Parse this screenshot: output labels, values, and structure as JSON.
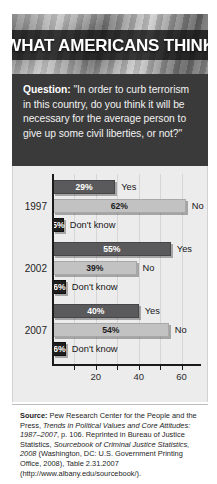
{
  "header": {
    "title": "WHAT AMERICANS THINK",
    "background": "american-flag-photo",
    "band_color": "#121212"
  },
  "question": {
    "label": "Question:",
    "text": "\"In order to curb terrorism in this country, do you think it will be necessary for the average person to give up some civil liberties, or not?\""
  },
  "chart_data": {
    "type": "bar",
    "orientation": "horizontal",
    "title": "",
    "xlabel": "",
    "ylabel": "",
    "xlim": [
      0,
      70
    ],
    "ticks": [
      20,
      40,
      60
    ],
    "minor_ticks": [
      10,
      20,
      30,
      40,
      50,
      60
    ],
    "grid": true,
    "legend": "inline-end-labels",
    "categories": [
      "1997",
      "2002",
      "2007"
    ],
    "series": [
      {
        "name": "Yes",
        "values": [
          29,
          55,
          40
        ],
        "color": "#5a5a5c"
      },
      {
        "name": "No",
        "values": [
          62,
          39,
          54
        ],
        "color": "#c2c2c2"
      },
      {
        "name": "Don't know",
        "values": [
          5,
          6,
          6
        ],
        "color": "#1e1e1e"
      }
    ],
    "groups": [
      {
        "year": "1997",
        "bars": [
          {
            "label": "Yes",
            "value": 29,
            "display": "29%",
            "style": "yes"
          },
          {
            "label": "No",
            "value": 62,
            "display": "62%",
            "style": "no"
          },
          {
            "label": "Don't know",
            "value": 5,
            "display": "5%",
            "style": "dk"
          }
        ]
      },
      {
        "year": "2002",
        "bars": [
          {
            "label": "Yes",
            "value": 55,
            "display": "55%",
            "style": "yes"
          },
          {
            "label": "No",
            "value": 39,
            "display": "39%",
            "style": "no"
          },
          {
            "label": "Don't know",
            "value": 6,
            "display": "6%",
            "style": "dk"
          }
        ]
      },
      {
        "year": "2007",
        "bars": [
          {
            "label": "Yes",
            "value": 40,
            "display": "40%",
            "style": "yes"
          },
          {
            "label": "No",
            "value": 54,
            "display": "54%",
            "style": "no"
          },
          {
            "label": "Don't know",
            "value": 6,
            "display": "6%",
            "style": "dk"
          }
        ]
      }
    ]
  },
  "source": {
    "label": "Source:",
    "segments": [
      {
        "text": " Pew Research Center for the People and the Press, ",
        "style": "normal"
      },
      {
        "text": "Trends in Political Values and Core Attitudes: 1987–2007",
        "style": "italic"
      },
      {
        "text": ", p. 106. Reprinted in Bureau of Justice Statistics, ",
        "style": "normal"
      },
      {
        "text": "Sourcebook of Criminal Justice Statistics, 2008",
        "style": "italic"
      },
      {
        "text": " (Washington, DC: U.S. Government Printing Office, 2008), Table 2.31.2007 (http://www.albany.edu/sourcebook/).",
        "style": "normal"
      }
    ]
  }
}
